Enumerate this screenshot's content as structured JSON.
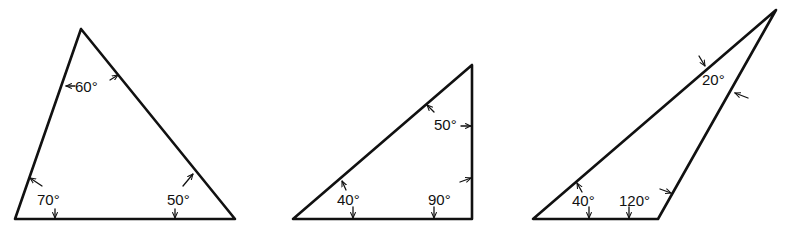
{
  "figure": {
    "stroke_color": "#111111",
    "background_color": "#ffffff",
    "triangles": [
      {
        "name": "acute-triangle",
        "angles": [
          {
            "vertex": "top",
            "label": "60°"
          },
          {
            "vertex": "bottom-left",
            "label": "70°"
          },
          {
            "vertex": "bottom-right",
            "label": "50°"
          }
        ]
      },
      {
        "name": "right-triangle",
        "angles": [
          {
            "vertex": "top",
            "label": "50°"
          },
          {
            "vertex": "bottom-left",
            "label": "40°"
          },
          {
            "vertex": "bottom-right",
            "label": "90°"
          }
        ]
      },
      {
        "name": "obtuse-triangle",
        "angles": [
          {
            "vertex": "top",
            "label": "20°"
          },
          {
            "vertex": "bottom-left",
            "label": "40°"
          },
          {
            "vertex": "bottom-right",
            "label": "120°"
          }
        ]
      }
    ]
  }
}
